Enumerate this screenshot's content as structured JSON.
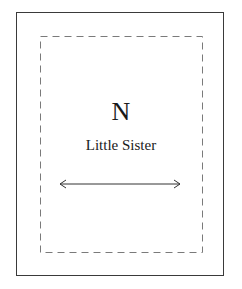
{
  "diagram": {
    "letter": "N",
    "caption": "Little Sister",
    "arrow": {
      "type": "double-headed-horizontal"
    },
    "colors": {
      "outer_border": "#3a3a3a",
      "dashed_border": "#7a7a7a",
      "text": "#1a1a1a"
    }
  }
}
